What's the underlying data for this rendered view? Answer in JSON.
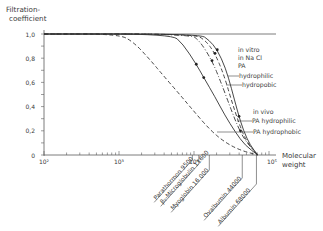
{
  "chart_data": {
    "type": "line",
    "title": "",
    "ylabel": "Filtration-\ncoefficient",
    "xlabel": "Molecular\nweight",
    "xscale": "log",
    "xlim_log10": [
      2,
      5.1
    ],
    "ylim": [
      0,
      1.0
    ],
    "y_ticks": [
      {
        "value": 0,
        "label": "0"
      },
      {
        "value": 0.2,
        "label": "0,2"
      },
      {
        "value": 0.4,
        "label": "0,4"
      },
      {
        "value": 0.6,
        "label": "0,6"
      },
      {
        "value": 0.8,
        "label": "0,8"
      },
      {
        "value": 1.0,
        "label": "1,0"
      }
    ],
    "x_ticks": [
      {
        "log10": 2,
        "label": "10²"
      },
      {
        "log10": 3,
        "label": "10³"
      },
      {
        "log10": 4,
        "label": "10⁴"
      },
      {
        "log10": 5,
        "label": "10⁵"
      }
    ],
    "grid": false,
    "series": [
      {
        "name": "reference (dashed)",
        "style": "dashed",
        "points": [
          [
            2.0,
            1.0
          ],
          [
            3.0,
            1.0
          ],
          [
            3.2,
            0.93
          ],
          [
            3.41,
            0.79
          ],
          [
            3.6,
            0.65
          ],
          [
            3.81,
            0.5
          ],
          [
            4.0,
            0.36
          ],
          [
            4.21,
            0.21
          ],
          [
            4.4,
            0.11
          ],
          [
            4.61,
            0.04
          ],
          [
            4.85,
            0.0
          ]
        ],
        "markers": []
      },
      {
        "name": "in vivo PA hydrophilic",
        "style": "solid",
        "points": [
          [
            2.0,
            1.0
          ],
          [
            3.7,
            1.0
          ],
          [
            3.85,
            0.92
          ],
          [
            4.03,
            0.75
          ],
          [
            4.13,
            0.64
          ],
          [
            4.28,
            0.48
          ],
          [
            4.41,
            0.33
          ],
          [
            4.55,
            0.19
          ],
          [
            4.68,
            0.08
          ],
          [
            4.85,
            0.0
          ]
        ],
        "markers": [
          [
            4.03,
            0.75
          ],
          [
            4.13,
            0.64
          ]
        ]
      },
      {
        "name": "in vivo PA hydrophobic",
        "style": "dashdot",
        "points": [
          [
            2.0,
            1.0
          ],
          [
            3.95,
            1.0
          ],
          [
            4.08,
            0.94
          ],
          [
            4.24,
            0.78
          ],
          [
            4.36,
            0.6
          ],
          [
            4.48,
            0.4
          ],
          [
            4.58,
            0.24
          ],
          [
            4.68,
            0.12
          ],
          [
            4.85,
            0.0
          ]
        ],
        "markers": [
          [
            4.24,
            0.78
          ],
          [
            4.62,
            0.2
          ]
        ]
      },
      {
        "name": "in vitro in NaCl PA hydrophobic",
        "style": "dashed",
        "points": [
          [
            2.0,
            1.0
          ],
          [
            4.0,
            1.0
          ],
          [
            4.15,
            0.95
          ],
          [
            4.28,
            0.84
          ],
          [
            4.4,
            0.66
          ],
          [
            4.5,
            0.45
          ],
          [
            4.6,
            0.26
          ],
          [
            4.7,
            0.11
          ],
          [
            4.85,
            0.0
          ]
        ],
        "markers": [
          [
            4.28,
            0.84
          ]
        ]
      },
      {
        "name": "in vitro in NaCl PA hydrophilic",
        "style": "solid",
        "points": [
          [
            2.0,
            1.0
          ],
          [
            4.08,
            1.0
          ],
          [
            4.2,
            0.95
          ],
          [
            4.31,
            0.87
          ],
          [
            4.42,
            0.72
          ],
          [
            4.5,
            0.55
          ],
          [
            4.58,
            0.36
          ],
          [
            4.66,
            0.2
          ],
          [
            4.75,
            0.08
          ],
          [
            4.85,
            0.0
          ]
        ],
        "markers": [
          [
            4.31,
            0.87
          ],
          [
            4.6,
            0.32
          ]
        ]
      }
    ],
    "annotations": {
      "in_vitro_header": [
        "in vitro",
        "in Na Cl",
        "PA"
      ],
      "in_vitro_hydrophilic": "hydrophilic",
      "in_vitro_hydrophobic": "hydropobic",
      "in_vivo_header": "in vivo",
      "in_vivo_hydrophilic": "PA hydrophilic",
      "in_vivo_hydrophobic": "PA hydrophobic"
    },
    "molecules": [
      {
        "label": "Parathormon 9500",
        "mw": 9500
      },
      {
        "label": "β₂-Microglobulin 11600",
        "mw": 11600
      },
      {
        "label": "Myoglobin 16 000",
        "mw": 16000
      },
      {
        "label": "Ovalbumin 44000",
        "mw": 44000
      },
      {
        "label": "Albumin 68000",
        "mw": 68000
      }
    ]
  }
}
